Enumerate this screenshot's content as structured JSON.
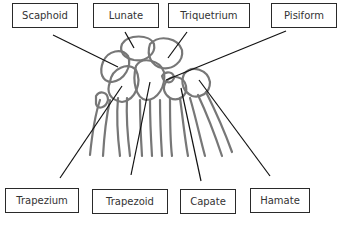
{
  "diagram": {
    "top_labels": [
      {
        "text": "Scaphoid"
      },
      {
        "text": "Lunate"
      },
      {
        "text": "Triquetrium"
      },
      {
        "text": "Pisiform"
      }
    ],
    "bottom_labels": [
      {
        "text": "Trapezium"
      },
      {
        "text": "Trapezoid"
      },
      {
        "text": "Capate"
      },
      {
        "text": "Hamate"
      }
    ]
  }
}
